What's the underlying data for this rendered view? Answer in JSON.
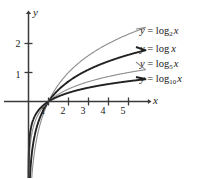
{
  "figure": {
    "background_color": "#ffffff",
    "axis_color": "#3a3a3a",
    "text_color": "#1a1a1a"
  },
  "axes": {
    "x_axis_name": "x",
    "y_axis_name": "y",
    "x_tick_labels": [
      "1",
      "2",
      "3",
      "4",
      "5"
    ],
    "y_tick_labels": [
      "1",
      "2"
    ]
  },
  "labels": {
    "log2": {
      "lhs": "y",
      "eq": "=",
      "fn": "log",
      "base": "2",
      "arg": "x"
    },
    "log": {
      "lhs": "y",
      "eq": "=",
      "fn": "log",
      "base": "",
      "arg": "x"
    },
    "log5": {
      "lhs": "y",
      "eq": "=",
      "fn": "log",
      "base": "5",
      "arg": "x"
    },
    "log10": {
      "lhs": "y",
      "eq": "=",
      "fn": "log",
      "base": "10",
      "arg": "x"
    }
  },
  "chart_data": {
    "type": "line",
    "title": "",
    "xlabel": "x",
    "ylabel": "y",
    "xlim": [
      0,
      6.2
    ],
    "ylim": [
      -3.0,
      2.8
    ],
    "grid": false,
    "legend": "inline-right-of-curves",
    "x_ticks": [
      1,
      2,
      3,
      4,
      5
    ],
    "y_ticks": [
      1,
      2
    ],
    "series": [
      {
        "name": "y = log_2 x",
        "base": 2,
        "color": "#8c8c8c",
        "width": 1.1,
        "x": [
          0.12,
          0.2,
          0.3,
          0.45,
          0.6,
          0.8,
          1.0,
          1.3,
          1.6,
          2.0,
          2.5,
          3.0,
          3.5,
          4.0,
          4.5,
          5.0,
          5.5
        ],
        "values": [
          -3.06,
          -2.32,
          -1.74,
          -1.15,
          -0.74,
          -0.32,
          0.0,
          0.38,
          0.68,
          1.0,
          1.32,
          1.58,
          1.81,
          2.0,
          2.17,
          2.32,
          2.46
        ]
      },
      {
        "name": "y = log x",
        "base": 2.718281828,
        "color": "#222222",
        "width": 1.9,
        "x": [
          0.12,
          0.2,
          0.3,
          0.45,
          0.6,
          0.8,
          1.0,
          1.3,
          1.6,
          2.0,
          2.5,
          3.0,
          3.5,
          4.0,
          4.5,
          5.0,
          5.5
        ],
        "values": [
          -2.12,
          -1.61,
          -1.2,
          -0.8,
          -0.51,
          -0.22,
          0.0,
          0.26,
          0.47,
          0.69,
          0.92,
          1.1,
          1.25,
          1.39,
          1.5,
          1.61,
          1.7
        ]
      },
      {
        "name": "y = log_5 x",
        "base": 5,
        "color": "#8c8c8c",
        "width": 1.1,
        "x": [
          0.12,
          0.2,
          0.3,
          0.45,
          0.6,
          0.8,
          1.0,
          1.3,
          1.6,
          2.0,
          2.5,
          3.0,
          3.5,
          4.0,
          4.5,
          5.0,
          5.5
        ],
        "values": [
          -1.32,
          -1.0,
          -0.75,
          -0.5,
          -0.32,
          -0.14,
          0.0,
          0.16,
          0.29,
          0.43,
          0.57,
          0.68,
          0.78,
          0.86,
          0.93,
          1.0,
          1.06
        ]
      },
      {
        "name": "y = log_10 x",
        "base": 10,
        "color": "#222222",
        "width": 1.9,
        "x": [
          0.12,
          0.2,
          0.3,
          0.45,
          0.6,
          0.8,
          1.0,
          1.3,
          1.6,
          2.0,
          2.5,
          3.0,
          3.5,
          4.0,
          4.5,
          5.0,
          5.5
        ],
        "values": [
          -0.92,
          -0.7,
          -0.52,
          -0.35,
          -0.22,
          -0.1,
          0.0,
          0.11,
          0.2,
          0.3,
          0.4,
          0.48,
          0.54,
          0.6,
          0.65,
          0.7,
          0.74
        ]
      }
    ]
  }
}
